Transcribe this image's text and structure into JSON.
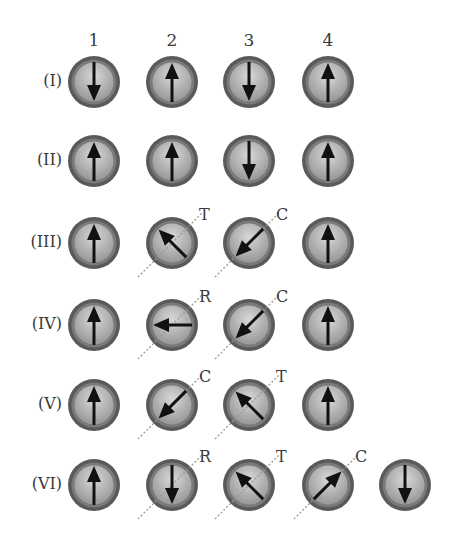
{
  "columns": [
    {
      "label": "1",
      "x": 94
    },
    {
      "label": "2",
      "x": 172
    },
    {
      "label": "3",
      "x": 249
    },
    {
      "label": "4",
      "x": 328
    },
    {
      "label": "",
      "x": 405
    }
  ],
  "rows": [
    {
      "label": "(I)",
      "y": 82,
      "cells": [
        {
          "col": 0,
          "angle": 180
        },
        {
          "col": 1,
          "angle": 0
        },
        {
          "col": 2,
          "angle": 180
        },
        {
          "col": 3,
          "angle": 0
        }
      ]
    },
    {
      "label": "(II)",
      "y": 161,
      "cells": [
        {
          "col": 0,
          "angle": 0
        },
        {
          "col": 1,
          "angle": 0
        },
        {
          "col": 2,
          "angle": 180
        },
        {
          "col": 3,
          "angle": 0
        }
      ]
    },
    {
      "label": "(III)",
      "y": 243,
      "cells": [
        {
          "col": 0,
          "angle": 0
        },
        {
          "col": 1,
          "angle": -45,
          "axis": true,
          "tag": "T"
        },
        {
          "col": 2,
          "angle": 225,
          "axis": true,
          "tag": "C"
        },
        {
          "col": 3,
          "angle": 0
        }
      ]
    },
    {
      "label": "(IV)",
      "y": 325,
      "cells": [
        {
          "col": 0,
          "angle": 0
        },
        {
          "col": 1,
          "angle": -90,
          "axis": true,
          "tag": "R"
        },
        {
          "col": 2,
          "angle": 225,
          "axis": true,
          "tag": "C"
        },
        {
          "col": 3,
          "angle": 0
        }
      ]
    },
    {
      "label": "(V)",
      "y": 405,
      "cells": [
        {
          "col": 0,
          "angle": 0
        },
        {
          "col": 1,
          "angle": 225,
          "axis": true,
          "tag": "C"
        },
        {
          "col": 2,
          "angle": -45,
          "axis": true,
          "tag": "T"
        },
        {
          "col": 3,
          "angle": 0
        }
      ]
    },
    {
      "label": "(VI)",
      "y": 485,
      "cells": [
        {
          "col": 0,
          "angle": 0
        },
        {
          "col": 1,
          "angle": 180,
          "axis": true,
          "tag": "R"
        },
        {
          "col": 2,
          "angle": -45,
          "axis": true,
          "tag": "T"
        },
        {
          "col": 3,
          "angle": 45,
          "axis": true,
          "tag": "C"
        },
        {
          "col": 4,
          "angle": 180
        }
      ]
    }
  ],
  "colors": {
    "outer_ring": "#5a5a5a",
    "mid_ring": "#7a7a7a",
    "inner_fill": "#b4b4b4",
    "highlight": "#d8d8d8",
    "arrow": "#111111",
    "axis_line": "#9a9a9a"
  }
}
